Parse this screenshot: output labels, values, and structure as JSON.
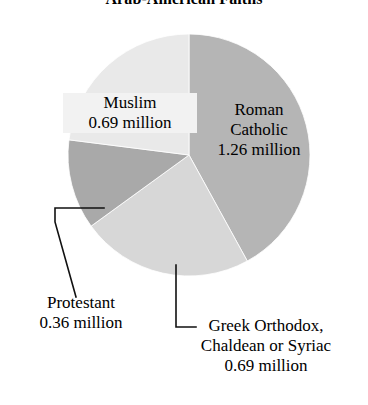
{
  "chart_data": {
    "type": "pie",
    "title": "Arab-American Faiths",
    "xlabel": "",
    "ylabel": "",
    "unit": "million",
    "legend_position": "none",
    "grid": false,
    "categories": [
      "Roman Catholic",
      "Greek Orthodox, Chaldean or Syriac",
      "Protestant",
      "Muslim"
    ],
    "values": [
      1.26,
      0.69,
      0.36,
      0.69
    ],
    "total": 3.0,
    "slices": [
      {
        "name": "Roman Catholic",
        "name_line1": "Roman",
        "name_line2": "Catholic",
        "value": 1.26,
        "value_label": "1.26 million",
        "percent": 42,
        "color": "#b5b5b5",
        "start_angle": 0,
        "end_angle": 151.2
      },
      {
        "name": "Greek Orthodox, Chaldean or Syriac",
        "name_line1": "Greek Orthodox,",
        "name_line2": "Chaldean or Syriac",
        "value": 0.69,
        "value_label": "0.69 million",
        "percent": 23,
        "color": "#d7d7d7",
        "start_angle": 151.2,
        "end_angle": 234
      },
      {
        "name": "Protestant",
        "name_line1": "Protestant",
        "name_line2": "",
        "value": 0.36,
        "value_label": "0.36 million",
        "percent": 12,
        "color": "#a9a9a9",
        "start_angle": 234,
        "end_angle": 277.2
      },
      {
        "name": "Muslim",
        "name_line1": "Muslim",
        "name_line2": "",
        "value": 0.69,
        "value_label": "0.69 million",
        "percent": 23,
        "color": "#e9e9e9",
        "start_angle": 277.2,
        "end_angle": 360
      }
    ]
  },
  "labels": {
    "muslim": {
      "name": "Muslim",
      "value": "0.69 million"
    },
    "roman_catholic": {
      "name": "Roman",
      "name2": "Catholic",
      "value": "1.26 million"
    },
    "protestant": {
      "name": "Protestant",
      "value": "0.36 million"
    },
    "greek_orthodox": {
      "name": "Greek Orthodox,",
      "name2": "Chaldean or Syriac",
      "value": "0.69 million"
    }
  },
  "colors": {
    "background": "#ffffff",
    "text": "#000000",
    "leader_line": "#111111",
    "roman_catholic": "#b5b5b5",
    "greek_orthodox": "#d7d7d7",
    "protestant": "#a9a9a9",
    "muslim": "#e9e9e9"
  }
}
